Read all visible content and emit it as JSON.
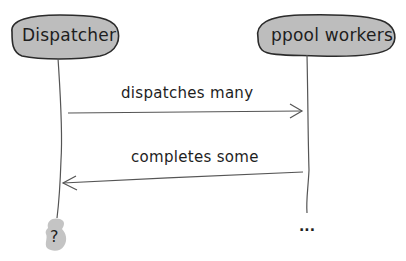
{
  "diagram": {
    "type": "sequence",
    "colors": {
      "actor_fill": "#bdbdbd",
      "end_fill": "#c4c4c4",
      "stroke": "#2b2b2b",
      "line": "#555555",
      "text": "#1e1e1e"
    },
    "actors": [
      {
        "id": "dispatcher",
        "label": "Dispatcher",
        "end_marker": "?"
      },
      {
        "id": "ppool",
        "label": "ppool workers",
        "end_marker": "..."
      }
    ],
    "messages": [
      {
        "from": "dispatcher",
        "to": "ppool",
        "label": "dispatches many"
      },
      {
        "from": "ppool",
        "to": "dispatcher",
        "label": "completes some"
      }
    ]
  }
}
